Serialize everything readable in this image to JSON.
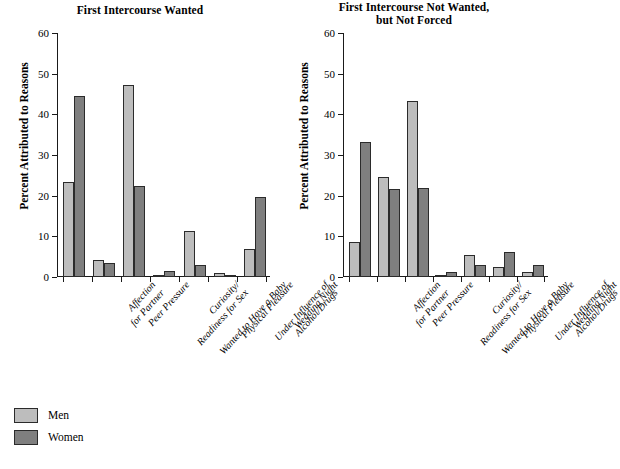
{
  "chart_data": {
    "type": "bar",
    "title": "",
    "panels": [
      {
        "title": "First Intercourse Wanted",
        "title_lines": [
          "First Intercourse Wanted"
        ],
        "categories": [
          "Affection for Partner",
          "Peer Pressure",
          "Curiosity/Readiness for Sex",
          "Wanted to Have a Baby",
          "Physical Pleasure",
          "Under Influence of Alcohol/Drugs",
          "Wedding Night"
        ],
        "category_lines": [
          [
            "Affection",
            "for Partner"
          ],
          [
            "Peer Pressure"
          ],
          [
            "Curiosity/",
            "Readiness for Sex"
          ],
          [
            "Wanted to Have a Baby"
          ],
          [
            "Physical Pleasure"
          ],
          [
            "Under Influence of",
            "Alcohol/Drugs"
          ],
          [
            "Wedding Night"
          ]
        ],
        "series": [
          {
            "name": "Men",
            "values": [
              23.3,
              4.2,
              47.2,
              0.4,
              11.2,
              0.9,
              7.0
            ]
          },
          {
            "name": "Women",
            "values": [
              44.6,
              3.5,
              22.3,
              1.6,
              2.9,
              0.4,
              19.6
            ]
          }
        ]
      },
      {
        "title": "First Intercourse Not Wanted, but Not Forced",
        "title_lines": [
          "First Intercourse Not Wanted,",
          "but Not Forced"
        ],
        "categories": [
          "Affection for Partner",
          "Peer Pressure",
          "Curiosity/Readiness for Sex",
          "Wanted to Have a Baby",
          "Physical Pleasure",
          "Under Influence of Alcohol/Drugs",
          "Wedding Night"
        ],
        "category_lines": [
          [
            "Affection",
            "for Partner"
          ],
          [
            "Peer Pressure"
          ],
          [
            "Curiosity/",
            "Readiness for Sex"
          ],
          [
            "Wanted to Have a Baby"
          ],
          [
            "Physical Pleasure"
          ],
          [
            "Under Influence of",
            "Alcohol/Drugs"
          ],
          [
            "Wedding Night"
          ]
        ],
        "series": [
          {
            "name": "Men",
            "values": [
              8.6,
              24.7,
              43.4,
              0.4,
              5.3,
              2.4,
              1.2
            ]
          },
          {
            "name": "Women",
            "values": [
              33.1,
              21.7,
              21.8,
              1.3,
              2.9,
              6.2,
              2.9
            ]
          }
        ]
      }
    ],
    "ylabel": "Percent Attributed to Reasons",
    "xlabel": "",
    "ylim": [
      0,
      60
    ],
    "yticks": [
      0,
      10,
      20,
      30,
      40,
      50,
      60
    ],
    "ytick_labels": [
      "0",
      "10",
      "20",
      "30",
      "40",
      "50",
      "60"
    ],
    "grid": false,
    "legend": {
      "position": "bottom-left",
      "entries": [
        {
          "label": "Men",
          "color": "#bdbdbd"
        },
        {
          "label": "Women",
          "color": "#7f7f7f"
        }
      ]
    },
    "colors": {
      "men": "#bdbdbd",
      "women": "#7f7f7f",
      "axis": "#1a1a1a",
      "background": "#ffffff"
    }
  }
}
